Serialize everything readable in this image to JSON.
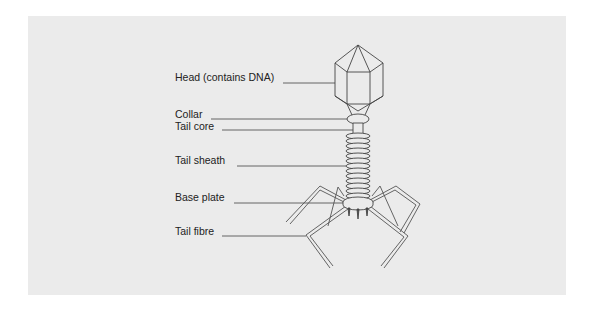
{
  "diagram": {
    "labels": [
      {
        "id": "head",
        "text": "Head (contains DNA)",
        "x": 175,
        "y": 77
      },
      {
        "id": "collar",
        "text": "Collar",
        "x": 175,
        "y": 113
      },
      {
        "id": "tail-core",
        "text": "Tail core",
        "x": 175,
        "y": 125
      },
      {
        "id": "tail-sheath",
        "text": "Tail sheath",
        "x": 175,
        "y": 159
      },
      {
        "id": "base-plate",
        "text": "Base plate",
        "x": 175,
        "y": 196
      },
      {
        "id": "tail-fibre",
        "text": "Tail fibre",
        "x": 175,
        "y": 230
      }
    ],
    "colors": {
      "background": "#ebebeb",
      "stroke": "#444444",
      "text": "#222222"
    }
  }
}
